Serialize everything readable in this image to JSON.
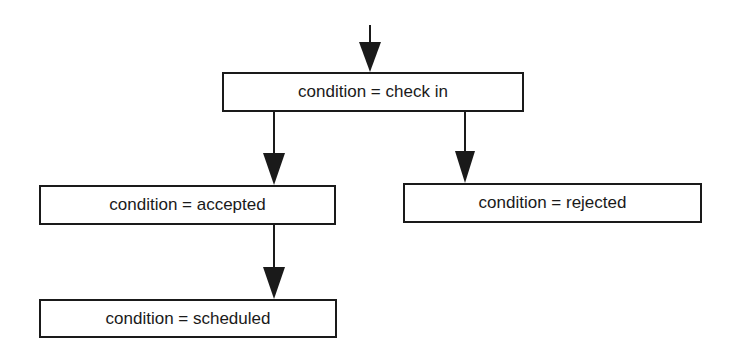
{
  "diagram": {
    "type": "flowchart",
    "nodes": [
      {
        "id": "check_in",
        "label": "condition = check in"
      },
      {
        "id": "accepted",
        "label": "condition = accepted"
      },
      {
        "id": "rejected",
        "label": "condition = rejected"
      },
      {
        "id": "scheduled",
        "label": "condition = scheduled"
      }
    ],
    "edges": [
      {
        "from": "start",
        "to": "check_in"
      },
      {
        "from": "check_in",
        "to": "accepted"
      },
      {
        "from": "check_in",
        "to": "rejected"
      },
      {
        "from": "accepted",
        "to": "scheduled"
      }
    ],
    "colors": {
      "stroke": "#1a1a1a",
      "background": "#ffffff"
    }
  }
}
